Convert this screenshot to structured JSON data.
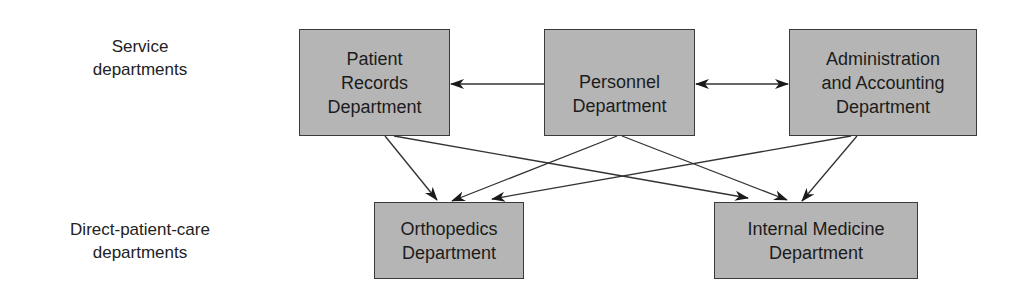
{
  "rows": {
    "service_label": "Service\ndepartments",
    "direct_label": "Direct-patient-care\ndepartments"
  },
  "nodes": {
    "patient_records": "Patient\nRecords\nDepartment",
    "personnel": "Personnel\nDepartment",
    "admin_accounting": "Administration\nand Accounting\nDepartment",
    "orthopedics": "Orthopedics\nDepartment",
    "internal_medicine": "Internal Medicine\nDepartment"
  },
  "edges": [
    {
      "from": "personnel",
      "to": "patient_records",
      "type": "one-way"
    },
    {
      "from": "personnel",
      "to": "admin_accounting",
      "type": "two-way"
    },
    {
      "from": "patient_records",
      "to": "orthopedics",
      "type": "one-way"
    },
    {
      "from": "patient_records",
      "to": "internal_medicine",
      "type": "one-way"
    },
    {
      "from": "personnel",
      "to": "orthopedics",
      "type": "one-way"
    },
    {
      "from": "personnel",
      "to": "internal_medicine",
      "type": "one-way"
    },
    {
      "from": "admin_accounting",
      "to": "orthopedics",
      "type": "one-way"
    },
    {
      "from": "admin_accounting",
      "to": "internal_medicine",
      "type": "one-way"
    }
  ],
  "colors": {
    "box_fill": "#b5b5b5",
    "box_border": "#3a3a3a",
    "line": "#333333"
  }
}
